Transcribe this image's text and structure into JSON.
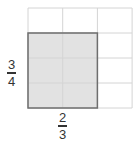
{
  "diagram": {
    "grid": {
      "columns": 3,
      "rows": 4
    },
    "shaded": {
      "columns": 2,
      "rows": 3,
      "position": "bottom-left"
    },
    "colors": {
      "grid_line": "#d4d4d4",
      "shade": "#e2e2e2",
      "shade_border": "#6e6e6e"
    },
    "vertical_label": {
      "numerator": "3",
      "denominator": "4"
    },
    "horizontal_label": {
      "numerator": "2",
      "denominator": "3"
    }
  }
}
